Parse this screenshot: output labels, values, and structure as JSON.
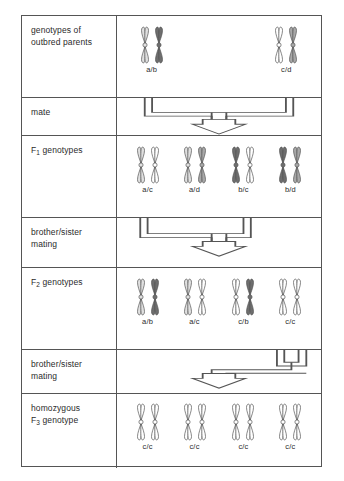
{
  "diagram": {
    "allele_colors": {
      "a": "#e0e0e0",
      "b": "#6e6e6e",
      "c": "#ffffff",
      "d": "#a8a8a8",
      "outline": "#555555"
    },
    "rows": [
      {
        "id": "parents",
        "label_lines": [
          "genotypes of",
          "outbred parents"
        ],
        "label_sub": "",
        "type": "genotypes",
        "groups": [
          {
            "genotype": "a/b",
            "alleles": [
              "a",
              "b"
            ],
            "x_pct": 17
          },
          {
            "genotype": "c/d",
            "alleles": [
              "c",
              "d"
            ],
            "x_pct": 83
          }
        ]
      },
      {
        "id": "mate",
        "label_lines": [
          "mate"
        ],
        "type": "connector",
        "connector": "mate-bracket"
      },
      {
        "id": "f1",
        "label_lines": [
          "F",
          " genotypes"
        ],
        "label_sub": "1",
        "type": "genotypes",
        "groups": [
          {
            "genotype": "a/c",
            "alleles": [
              "a",
              "c"
            ],
            "x_pct": 15
          },
          {
            "genotype": "a/d",
            "alleles": [
              "a",
              "d"
            ],
            "x_pct": 38
          },
          {
            "genotype": "b/c",
            "alleles": [
              "b",
              "c"
            ],
            "x_pct": 62
          },
          {
            "genotype": "b/d",
            "alleles": [
              "b",
              "d"
            ],
            "x_pct": 85
          }
        ]
      },
      {
        "id": "mating1",
        "label_lines": [
          "brother/sister",
          "mating"
        ],
        "type": "connector",
        "connector": "sib-bracket-1"
      },
      {
        "id": "f2",
        "label_lines": [
          "F",
          " genotypes"
        ],
        "label_sub": "2",
        "type": "genotypes",
        "groups": [
          {
            "genotype": "a/b",
            "alleles": [
              "a",
              "b"
            ],
            "x_pct": 15
          },
          {
            "genotype": "a/c",
            "alleles": [
              "a",
              "c"
            ],
            "x_pct": 38
          },
          {
            "genotype": "c/b",
            "alleles": [
              "c",
              "b"
            ],
            "x_pct": 62
          },
          {
            "genotype": "c/c",
            "alleles": [
              "c",
              "c"
            ],
            "x_pct": 85
          }
        ]
      },
      {
        "id": "mating2",
        "label_lines": [
          "brother/sister",
          "mating"
        ],
        "type": "connector",
        "connector": "sib-bracket-2"
      },
      {
        "id": "f3",
        "label_lines": [
          "homozygous",
          "F",
          " genotype"
        ],
        "label_sub": "3",
        "type": "genotypes",
        "groups": [
          {
            "genotype": "c/c",
            "alleles": [
              "c",
              "c"
            ],
            "x_pct": 15
          },
          {
            "genotype": "c/c",
            "alleles": [
              "c",
              "c"
            ],
            "x_pct": 38
          },
          {
            "genotype": "c/c",
            "alleles": [
              "c",
              "c"
            ],
            "x_pct": 62
          },
          {
            "genotype": "c/c",
            "alleles": [
              "c",
              "c"
            ],
            "x_pct": 85
          }
        ]
      }
    ]
  }
}
